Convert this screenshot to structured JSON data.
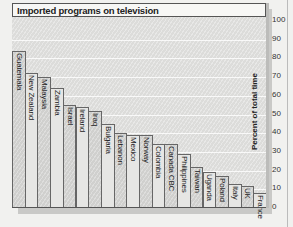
{
  "chart_data": {
    "type": "bar",
    "title": "Imported programs on television",
    "xlabel": "",
    "ylabel": "Percent of total time",
    "ylim": [
      0,
      100
    ],
    "yticks": [
      0,
      10,
      20,
      30,
      40,
      50,
      60,
      70,
      80,
      90,
      100
    ],
    "grid": true,
    "legend": null,
    "categories": [
      "Guatemala",
      "New Zealand",
      "Malaysia",
      "Zambia",
      "Israel",
      "Ireland",
      "Iraq",
      "Bulgaria",
      "Lebanon",
      "Mexico",
      "Norway",
      "Colombia",
      "Canada CBC",
      "Philippines",
      "Taiwan",
      "Uganda",
      "Poland",
      "Italy",
      "UK",
      "France"
    ],
    "values": [
      84,
      72,
      70,
      64,
      55,
      54,
      52,
      45,
      40,
      39,
      39,
      34,
      34,
      29,
      22,
      19,
      17,
      13,
      12,
      8
    ]
  },
  "axis": {
    "ticks": [
      "100",
      "90",
      "80",
      "70",
      "60",
      "50",
      "40",
      "30",
      "20",
      "10",
      "0"
    ]
  }
}
